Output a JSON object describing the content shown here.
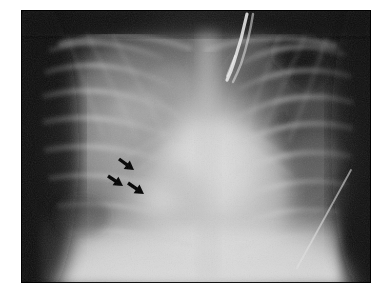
{
  "figure": {
    "modality": "chest-radiograph",
    "view": "AP portable chest",
    "caption": "",
    "background_color": "#ffffff",
    "plate": {
      "x": 21,
      "y": 10,
      "width": 350,
      "height": 273,
      "base_color": "#101010",
      "border_color": "#000000"
    }
  },
  "annotations": {
    "arrow_color": "#000000",
    "arrows": [
      {
        "id": "arrow-1",
        "label": "upper arrow",
        "tail_x": 119,
        "tail_y": 159,
        "tip_x": 134,
        "tip_y": 170,
        "angle_deg": 38
      },
      {
        "id": "arrow-2",
        "label": "left arrow",
        "tail_x": 108,
        "tail_y": 176,
        "tip_x": 123,
        "tip_y": 186,
        "angle_deg": 36
      },
      {
        "id": "arrow-3",
        "label": "lower arrow",
        "tail_x": 128,
        "tail_y": 183,
        "tip_x": 144,
        "tip_y": 194,
        "angle_deg": 38
      }
    ],
    "arrow_count": 3,
    "points_to": "right lower lung zone opacity"
  },
  "anatomy_regions": [
    {
      "id": "right-lung-field",
      "label": "Right lung field",
      "cx": 105,
      "cy": 120,
      "tone": "mid-grey",
      "description": "hazy interstitial markings"
    },
    {
      "id": "left-lung-field",
      "label": "Left lung field",
      "cx": 275,
      "cy": 120,
      "tone": "dark-grey",
      "description": "better aerated"
    },
    {
      "id": "left-apical-lucency",
      "label": "Left upper zone lucency",
      "cx": 296,
      "cy": 50,
      "tone": "near-black",
      "description": "rounded lucent area"
    },
    {
      "id": "mediastinum",
      "label": "Mediastinum / heart border",
      "cx": 205,
      "cy": 150,
      "tone": "bright",
      "description": "broad central opacity"
    },
    {
      "id": "right-lower-opacity",
      "label": "Right lower zone opacity",
      "cx": 160,
      "cy": 195,
      "tone": "bright",
      "description": "consolidation indicated by arrows"
    },
    {
      "id": "diaphragm",
      "label": "Diaphragm / upper abdomen",
      "cx": 190,
      "cy": 255,
      "tone": "bright",
      "description": "bright sub-diaphragmatic band"
    }
  ],
  "devices": [
    {
      "id": "endotracheal-tube",
      "label": "Endotracheal tube",
      "path_note": "bright curved tubular density descending from top-centre",
      "x1": 225,
      "y1": 12,
      "x2": 214,
      "y2": 62
    },
    {
      "id": "monitoring-lead",
      "label": "Monitoring lead / line",
      "path_note": "thin bright diagonal line over right lower hemithorax",
      "x1": 347,
      "y1": 175,
      "x2": 300,
      "y2": 268
    }
  ],
  "image_properties": {
    "width": 389,
    "height": 298,
    "grayscale": true,
    "colors": {
      "paper": "#ffffff",
      "darkest": "#090909",
      "brightest": "#e8e8e8",
      "arrow": "#000000"
    }
  }
}
